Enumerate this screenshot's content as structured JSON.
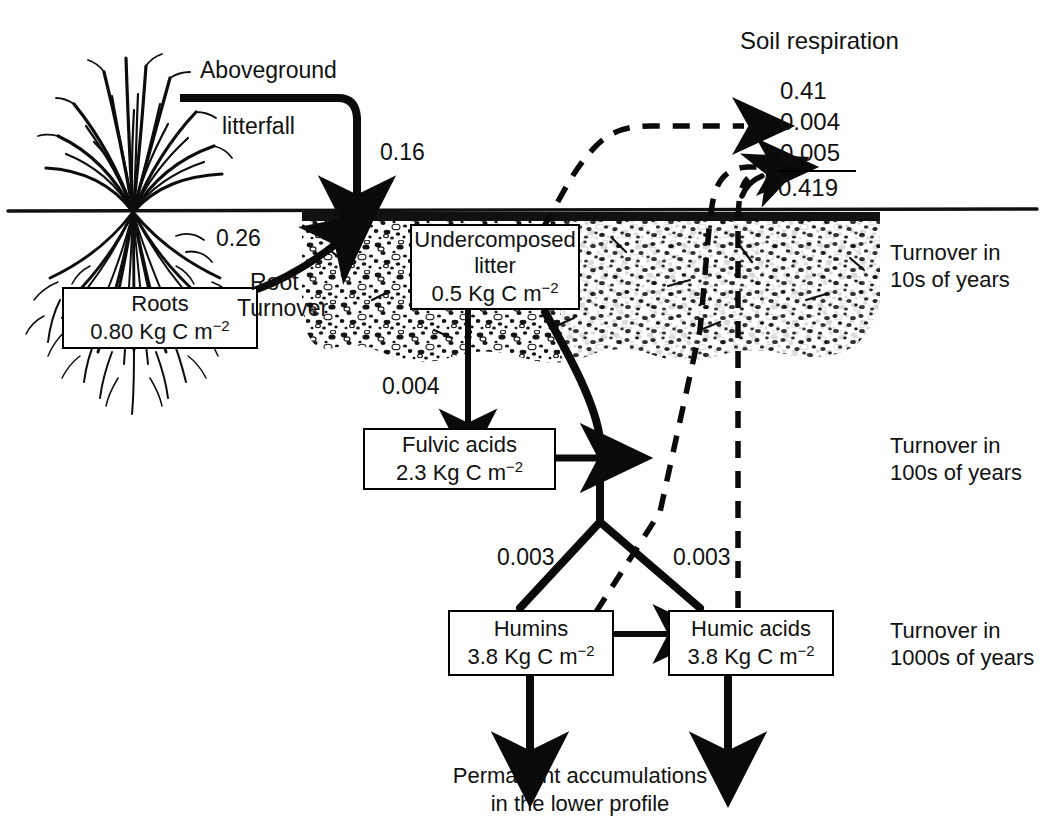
{
  "figure": {
    "title": "Soil respiration",
    "caption_line1": "Permanent accumulations",
    "caption_line2": "in the lower profile",
    "units": "Kg C m-2"
  },
  "pools": [
    {
      "id": "roots",
      "name": "Roots",
      "value": "0.80",
      "unit": "Kg C m",
      "exponent": "−2"
    },
    {
      "id": "undercomposed-litter",
      "name_line1": "Undercomposed",
      "name_line2": "litter",
      "value": "0.5",
      "unit": "Kg C m",
      "exponent": "−2"
    },
    {
      "id": "fulvic-acids",
      "name": "Fulvic acids",
      "value": "2.3",
      "unit": "Kg C m",
      "exponent": "−2"
    },
    {
      "id": "humins",
      "name": "Humins",
      "value": "3.8",
      "unit": "Kg C m",
      "exponent": "−2"
    },
    {
      "id": "humic-acids",
      "name": "Humic acids",
      "value": "3.8",
      "unit": "Kg C m",
      "exponent": "−2"
    }
  ],
  "fluxes": {
    "aboveground_litterfall_line1": "Aboveground",
    "aboveground_litterfall_line2": "litterfall",
    "aboveground_litterfall_value": "0.16",
    "root_turnover_line1": "Root",
    "root_turnover_line2": "Turnover",
    "root_turnover_value": "0.26",
    "litter_to_fulvic_value": "0.004",
    "to_humins_value": "0.003",
    "to_humic_acids_value": "0.003"
  },
  "respiration": {
    "label": "Soil respiration",
    "items": [
      {
        "value": "0.41",
        "source": "undercomposed-litter"
      },
      {
        "value": "0.004",
        "source": "humins"
      },
      {
        "value": "0.005",
        "source": "humic-acids"
      }
    ],
    "total": "0.419"
  },
  "turnover_notes": [
    {
      "line1": "Turnover in",
      "line2": "10s of years"
    },
    {
      "line1": "Turnover in",
      "line2": "100s of years"
    },
    {
      "line1": "Turnover in",
      "line2": "1000s of years"
    }
  ],
  "colors": {
    "ink": "#000000",
    "background": "#ffffff",
    "soil": "#1a1a1a"
  }
}
